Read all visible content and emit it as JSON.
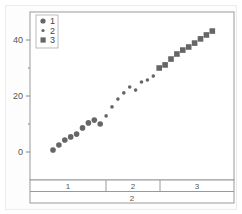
{
  "chart_data": {
    "type": "scatter",
    "title": "",
    "xlabel": "",
    "ylabel": "",
    "ylim": [
      -8,
      50
    ],
    "y_ticks": [
      0,
      20,
      40
    ],
    "y_minor_ticks": [
      10,
      30
    ],
    "grid": false,
    "legend_position": "upper-left",
    "series": [
      {
        "name": "1",
        "marker": "circle-large",
        "points": [
          {
            "x": 1,
            "y": 0.7
          },
          {
            "x": 2,
            "y": 2.5
          },
          {
            "x": 3,
            "y": 4.3
          },
          {
            "x": 4,
            "y": 5.4
          },
          {
            "x": 5,
            "y": 6.4
          },
          {
            "x": 6,
            "y": 8.6
          },
          {
            "x": 7,
            "y": 10.4
          },
          {
            "x": 8,
            "y": 11.4
          },
          {
            "x": 9,
            "y": 10.0
          }
        ]
      },
      {
        "name": "2",
        "marker": "circle-small",
        "points": [
          {
            "x": 10,
            "y": 12.9
          },
          {
            "x": 11,
            "y": 16.1
          },
          {
            "x": 12,
            "y": 18.9
          },
          {
            "x": 13,
            "y": 21.1
          },
          {
            "x": 14,
            "y": 23.2
          },
          {
            "x": 15,
            "y": 22.1
          },
          {
            "x": 16,
            "y": 25.0
          },
          {
            "x": 17,
            "y": 25.7
          },
          {
            "x": 18,
            "y": 27.1
          }
        ]
      },
      {
        "name": "3",
        "marker": "square",
        "points": [
          {
            "x": 19,
            "y": 30.0
          },
          {
            "x": 20,
            "y": 31.1
          },
          {
            "x": 21,
            "y": 33.2
          },
          {
            "x": 22,
            "y": 35.0
          },
          {
            "x": 23,
            "y": 36.4
          },
          {
            "x": 24,
            "y": 37.5
          },
          {
            "x": 25,
            "y": 38.9
          },
          {
            "x": 26,
            "y": 40.4
          },
          {
            "x": 27,
            "y": 41.8
          },
          {
            "x": 28,
            "y": 43.2
          }
        ]
      }
    ],
    "x_axis_groups": {
      "level1": [
        {
          "label": "1",
          "span": [
            1,
            9
          ]
        },
        {
          "label": "2",
          "span": [
            10,
            18
          ]
        },
        {
          "label": "3",
          "span": [
            19,
            28
          ]
        }
      ],
      "level2": [
        {
          "label": "2",
          "span": [
            1,
            28
          ]
        }
      ]
    },
    "colors": {
      "marker": "#666666",
      "frame": "#999999",
      "axis": "#888888"
    }
  }
}
